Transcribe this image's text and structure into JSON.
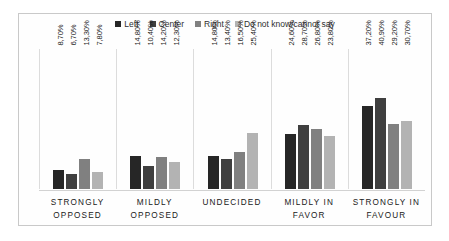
{
  "legend": {
    "items": [
      {
        "label": "Left",
        "color": "#262626"
      },
      {
        "label": "Center",
        "color": "#3f3f3f"
      },
      {
        "label": "Right",
        "color": "#808080"
      },
      {
        "label": "Do not know/cannot say",
        "color": "#b3b3b3"
      }
    ]
  },
  "chart_data": {
    "type": "bar",
    "title": "",
    "subtitle": "",
    "xlabel": "",
    "ylabel": "",
    "ylim": [
      0,
      45
    ],
    "grid": false,
    "legend_position": "top-center",
    "axis_tick_labels_visible": false,
    "data_label_format": "comma-decimal-percent",
    "data_label_rotation": -90,
    "categories": [
      "STRONGLY OPPOSED",
      "MILDLY OPPOSED",
      "UNDECIDED",
      "MILDLY IN FAVOR",
      "STRONGLY IN FAVOUR"
    ],
    "series": [
      {
        "name": "Left",
        "color": "#262626",
        "values": [
          8.7,
          14.8,
          14.8,
          24.6,
          37.2
        ],
        "labels": [
          "8,70%",
          "14,80%",
          "14,80%",
          "24,60%",
          "37,20%"
        ]
      },
      {
        "name": "Center",
        "color": "#3f3f3f",
        "values": [
          6.7,
          10.4,
          13.4,
          28.7,
          40.9
        ],
        "labels": [
          "6,70%",
          "10,40%",
          "13,40%",
          "28,70%",
          "40,90%"
        ]
      },
      {
        "name": "Right",
        "color": "#808080",
        "values": [
          13.3,
          14.2,
          16.5,
          26.8,
          29.2
        ],
        "labels": [
          "13,30%",
          "14,20%",
          "16,50%",
          "26,80%",
          "29,20%"
        ]
      },
      {
        "name": "Do not know/cannot say",
        "color": "#b3b3b3",
        "values": [
          7.8,
          12.3,
          25.4,
          23.8,
          30.7
        ],
        "labels": [
          "7,80%",
          "12,30%",
          "25,40%",
          "23,80%",
          "30,70%"
        ]
      }
    ]
  },
  "axis": {
    "categories": [
      {
        "line1": "STRONGLY",
        "line2": "OPPOSED"
      },
      {
        "line1": "MILDLY",
        "line2": "OPPOSED"
      },
      {
        "line1": "UNDECIDED",
        "line2": ""
      },
      {
        "line1": "MILDLY IN",
        "line2": "FAVOR"
      },
      {
        "line1": "STRONGLY IN",
        "line2": "FAVOUR"
      }
    ]
  }
}
